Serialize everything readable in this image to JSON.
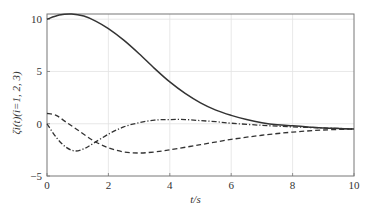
{
  "chart_data": {
    "type": "line",
    "title": "",
    "xlabel": "t/s",
    "ylabel": "ζi(t)(i=1, 2, 3)",
    "xlim": [
      0,
      10
    ],
    "ylim": [
      -5,
      10.5
    ],
    "xticks": [
      0,
      2,
      4,
      6,
      8,
      10
    ],
    "yticks": [
      -5,
      0,
      5,
      10
    ],
    "xtick_labels": [
      "0",
      "2",
      "4",
      "6",
      "8",
      "10"
    ],
    "ytick_labels": [
      "−5",
      "0",
      "5",
      "10"
    ],
    "grid": true,
    "legend": "none",
    "series": [
      {
        "name": "ζ1",
        "style": "solid",
        "x": [
          0,
          0.4,
          0.8,
          1.2,
          1.6,
          2,
          2.5,
          3,
          3.5,
          4,
          4.5,
          5,
          5.5,
          6,
          6.5,
          7,
          7.5,
          8,
          8.5,
          9,
          9.5,
          10
        ],
        "y": [
          10,
          10.4,
          10.5,
          10.3,
          9.8,
          9.1,
          8.0,
          6.7,
          5.3,
          4.0,
          2.9,
          2.0,
          1.3,
          0.8,
          0.4,
          0.1,
          -0.1,
          -0.2,
          -0.3,
          -0.4,
          -0.45,
          -0.5
        ]
      },
      {
        "name": "ζ2",
        "style": "dashdot",
        "x": [
          0,
          0.3,
          0.6,
          0.9,
          1.2,
          1.5,
          2,
          2.5,
          3,
          3.5,
          4,
          4.5,
          5,
          5.5,
          6,
          7,
          8,
          9,
          10
        ],
        "y": [
          0,
          -1.3,
          -2.2,
          -2.6,
          -2.4,
          -1.9,
          -1.0,
          -0.3,
          0.1,
          0.35,
          0.4,
          0.4,
          0.3,
          0.2,
          0.05,
          -0.15,
          -0.3,
          -0.4,
          -0.5
        ]
      },
      {
        "name": "ζ3",
        "style": "dashed",
        "x": [
          0,
          0.3,
          0.6,
          1.0,
          1.5,
          2,
          2.5,
          3,
          3.5,
          4,
          5,
          6,
          7,
          8,
          9,
          10
        ],
        "y": [
          1,
          0.8,
          0.2,
          -0.6,
          -1.6,
          -2.3,
          -2.7,
          -2.8,
          -2.7,
          -2.5,
          -2.0,
          -1.5,
          -1.1,
          -0.8,
          -0.6,
          -0.5
        ]
      }
    ]
  }
}
